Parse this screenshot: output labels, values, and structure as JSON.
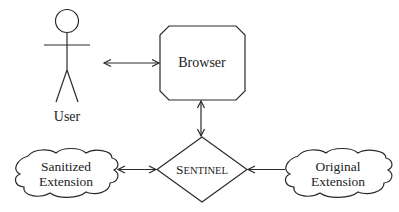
{
  "diagram": {
    "nodes": {
      "user": {
        "label": "User",
        "shape": "stick-figure"
      },
      "browser": {
        "label": "Browser",
        "shape": "octagon-box"
      },
      "sentinel": {
        "label_first": "S",
        "label_rest": "ENTINEL",
        "label": "SENTINEL",
        "shape": "diamond"
      },
      "sanitized": {
        "line1": "Sanitized",
        "line2": "Extension",
        "shape": "cloud"
      },
      "original": {
        "line1": "Original",
        "line2": "Extension",
        "shape": "cloud"
      }
    },
    "edges": [
      {
        "from": "user",
        "to": "browser",
        "direction": "bidirectional"
      },
      {
        "from": "browser",
        "to": "sentinel",
        "direction": "bidirectional"
      },
      {
        "from": "sanitized",
        "to": "sentinel",
        "direction": "bidirectional"
      },
      {
        "from": "original",
        "to": "sentinel",
        "direction": "to-sentinel"
      }
    ],
    "colors": {
      "stroke": "#2a2a2a",
      "background": "#ffffff"
    }
  }
}
